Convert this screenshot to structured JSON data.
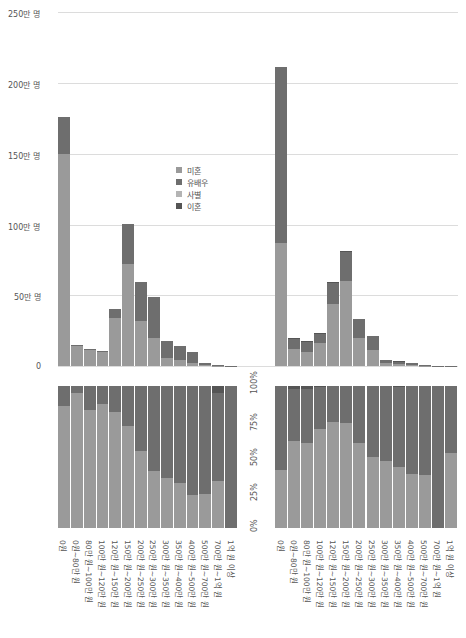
{
  "colors": {
    "never_married": "#9a9a9a",
    "married": "#6e6e6e",
    "widowed": "#b4b4b4",
    "divorced": "#555555",
    "grid": "#dcdcdc"
  },
  "legend": {
    "items": [
      {
        "label": "미혼",
        "key": "never_married"
      },
      {
        "label": "유배우",
        "key": "married"
      },
      {
        "label": "사별",
        "key": "widowed"
      },
      {
        "label": "이혼",
        "key": "divorced"
      }
    ]
  },
  "axes": {
    "count_ticks": [
      "250만 명",
      "200만 명",
      "150만 명",
      "100만 명",
      "50만 명",
      "0"
    ],
    "pct_ticks": [
      "100%",
      "75%",
      "50%",
      "25%",
      "0%"
    ]
  },
  "categories": [
    "0원",
    "0원~80만 원",
    "80만 원~100만 원",
    "100만 원~120만 원",
    "120만 원~150만 원",
    "150만 원~200만 원",
    "200만 원~250만 원",
    "250만 원~300만 원",
    "300만 원~350만 원",
    "350만 원~400만 원",
    "400만 원~500만 원",
    "500만 원~700만 원",
    "700만 원~1억 원",
    "1억 원 이상"
  ],
  "chart_data": [
    {
      "type": "bar",
      "stacked": true,
      "title": "",
      "xlabel": "",
      "ylabel": "",
      "ylim": [
        0,
        250
      ],
      "y_unit": "만 명",
      "grid": true,
      "legend_position": "inside-center",
      "categories": [
        "0원",
        "0원~80만 원",
        "80만 원~100만 원",
        "100만 원~120만 원",
        "120만 원~150만 원",
        "150만 원~200만 원",
        "200만 원~250만 원",
        "250만 원~300만 원",
        "300만 원~350만 원",
        "350만 원~400만 원",
        "400만 원~500만 원",
        "500만 원~700만 원",
        "700만 원~1억 원",
        "1억 원 이상"
      ],
      "series": [
        {
          "name": "미혼",
          "values": [
            150,
            14,
            11,
            10,
            34,
            72,
            32,
            20,
            6,
            4,
            2,
            0.4,
            0.2,
            0.1
          ]
        },
        {
          "name": "유배우",
          "values": [
            26,
            1,
            1,
            0.5,
            6,
            28,
            27,
            29,
            12,
            10,
            8,
            1.6,
            0.3,
            0.1
          ]
        },
        {
          "name": "사별",
          "values": [
            0,
            0,
            0,
            0,
            0,
            0,
            0,
            0,
            0,
            0,
            0,
            0,
            0,
            0
          ]
        },
        {
          "name": "이혼",
          "values": [
            0,
            0,
            0,
            0,
            0,
            0,
            0,
            0,
            0,
            0,
            0,
            0,
            0,
            0
          ]
        }
      ]
    },
    {
      "type": "bar",
      "stacked": true,
      "title": "",
      "ylim": [
        0,
        250
      ],
      "y_unit": "만 명",
      "grid": true,
      "categories": [
        "0원",
        "0원~80만 원",
        "80만 원~100만 원",
        "100만 원~120만 원",
        "120만 원~150만 원",
        "150만 원~200만 원",
        "200만 원~250만 원",
        "250만 원~300만 원",
        "300만 원~350만 원",
        "350만 원~400만 원",
        "400만 원~500만 원",
        "500만 원~700만 원",
        "700만 원~1억 원",
        "1억 원 이상"
      ],
      "series": [
        {
          "name": "미혼",
          "values": [
            87,
            12,
            10,
            16,
            44,
            60,
            20,
            11,
            2,
            1.5,
            0.8,
            0.3,
            0,
            0.1
          ]
        },
        {
          "name": "유배우",
          "values": [
            124,
            7,
            7,
            7,
            15,
            21,
            13,
            10,
            2.5,
            2,
            1.2,
            0.6,
            0.2,
            0.1
          ]
        },
        {
          "name": "사별",
          "values": [
            0,
            0,
            0,
            0,
            0,
            0,
            0,
            0,
            0,
            0,
            0,
            0,
            0,
            0
          ]
        },
        {
          "name": "이혼",
          "values": [
            0,
            0.6,
            0.5,
            0.3,
            0.2,
            0.2,
            0,
            0,
            0,
            0.1,
            0,
            0,
            0,
            0
          ]
        }
      ]
    },
    {
      "type": "bar",
      "stacked": true,
      "normalized": true,
      "ylim": [
        0,
        100
      ],
      "y_unit": "%",
      "categories": [
        "0원",
        "0원~80만 원",
        "80만 원~100만 원",
        "100만 원~120만 원",
        "120만 원~150만 원",
        "150만 원~200만 원",
        "200만 원~250만 원",
        "250만 원~300만 원",
        "300만 원~350만 원",
        "350만 원~400만 원",
        "400만 원~500만 원",
        "500만 원~700만 원",
        "700만 원~1억 원",
        "1억 원 이상"
      ],
      "series": [
        {
          "name": "미혼",
          "values": [
            86,
            95,
            83,
            87,
            82,
            72,
            54,
            40,
            35,
            32,
            23,
            24,
            33,
            0
          ]
        },
        {
          "name": "유배우",
          "values": [
            14,
            5,
            17,
            13,
            18,
            28,
            46,
            60,
            65,
            68,
            77,
            76,
            62,
            100
          ]
        },
        {
          "name": "사별",
          "values": [
            0,
            0,
            0,
            0,
            0,
            0,
            0,
            0,
            0,
            0,
            0,
            0,
            0,
            0
          ]
        },
        {
          "name": "이혼",
          "values": [
            0,
            0,
            0,
            0,
            0,
            0,
            0,
            0,
            0,
            0,
            0,
            0,
            5,
            0
          ]
        }
      ]
    },
    {
      "type": "bar",
      "stacked": true,
      "normalized": true,
      "ylim": [
        0,
        100
      ],
      "y_unit": "%",
      "categories": [
        "0원",
        "0원~80만 원",
        "80만 원~100만 원",
        "100만 원~120만 원",
        "120만 원~150만 원",
        "150만 원~200만 원",
        "200만 원~250만 원",
        "250만 원~300만 원",
        "300만 원~350만 원",
        "350만 원~400만 원",
        "400만 원~500만 원",
        "500만 원~700만 원",
        "700만 원~1억 원",
        "1억 원 이상"
      ],
      "series": [
        {
          "name": "미혼",
          "values": [
            41,
            61,
            60,
            70,
            75,
            74,
            60,
            50,
            47,
            43,
            38,
            37,
            0,
            53
          ]
        },
        {
          "name": "유배우",
          "values": [
            59,
            37,
            38,
            29,
            25,
            26,
            40,
            50,
            53,
            56,
            62,
            63,
            100,
            47
          ]
        },
        {
          "name": "사별",
          "values": [
            0,
            0,
            0,
            0,
            0,
            0,
            0,
            0,
            0,
            0,
            0,
            0,
            0,
            0
          ]
        },
        {
          "name": "이혼",
          "values": [
            0,
            2,
            2,
            1,
            0,
            0,
            0,
            0,
            0,
            1,
            0,
            0,
            0,
            0
          ]
        }
      ]
    }
  ]
}
